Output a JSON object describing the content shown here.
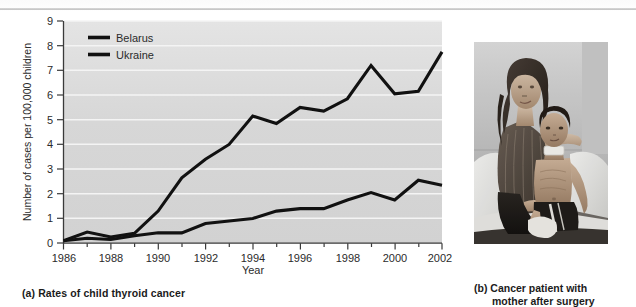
{
  "figure": {
    "panel_a_caption": "(a) Rates of child thyroid cancer",
    "panel_b_caption_line1": "(b) Cancer patient with",
    "panel_b_caption_line2": "mother after surgery",
    "photo_alt": "grayscale-photo-mother-and-child-on-hospital-bed"
  },
  "chart_data": {
    "type": "line",
    "title": "",
    "xlabel": "Year",
    "ylabel": "Number of cases per 100,000 children",
    "xlim": [
      1986,
      2002
    ],
    "ylim": [
      0,
      9
    ],
    "xticks": [
      1986,
      1988,
      1990,
      1992,
      1994,
      1996,
      1998,
      2000,
      2002
    ],
    "xtick_labels": [
      "1986",
      "1988",
      "1990",
      "1992",
      "1994",
      "1996",
      "1998",
      "2000",
      "2002"
    ],
    "xminor_ticks": [
      1987,
      1989,
      1991,
      1993,
      1995,
      1997,
      1999,
      2001
    ],
    "yticks": [
      0,
      1,
      2,
      3,
      4,
      5,
      6,
      7,
      8,
      9
    ],
    "ytick_labels": [
      "0",
      "1",
      "2",
      "3",
      "4",
      "5",
      "6",
      "7",
      "8",
      "9"
    ],
    "grid": "horizontal-white-gridlines",
    "legend_position": "top-left-inside",
    "plot_background": "#d6d6d6",
    "line_color": "#111111",
    "x": [
      1986,
      1987,
      1988,
      1989,
      1990,
      1991,
      1992,
      1993,
      1994,
      1995,
      1996,
      1997,
      1998,
      1999,
      2000,
      2001,
      2002
    ],
    "series": [
      {
        "name": "Belarus",
        "values": [
          0.1,
          0.45,
          0.25,
          0.4,
          1.3,
          2.65,
          3.4,
          4.0,
          5.15,
          4.85,
          5.5,
          5.35,
          5.85,
          7.2,
          6.05,
          6.15,
          7.75
        ]
      },
      {
        "name": "Ukraine",
        "values": [
          0.1,
          0.2,
          0.15,
          0.3,
          0.42,
          0.42,
          0.8,
          0.9,
          1.0,
          1.3,
          1.4,
          1.4,
          1.75,
          2.05,
          1.75,
          2.55,
          2.35
        ]
      }
    ],
    "legend": [
      "Belarus",
      "Ukraine"
    ]
  }
}
